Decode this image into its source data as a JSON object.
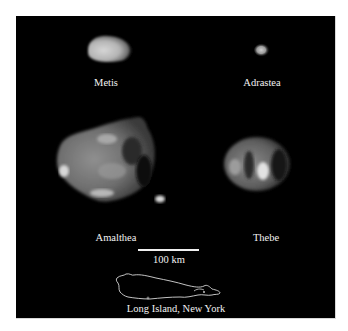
{
  "figure": {
    "moons": [
      {
        "name": "Metis",
        "label": "Metis"
      },
      {
        "name": "Adrastea",
        "label": "Adrastea"
      },
      {
        "name": "Amalthea",
        "label": "Amalthea"
      },
      {
        "name": "Thebe",
        "label": "Thebe"
      }
    ],
    "scale_bar": {
      "label": "100 km"
    },
    "reference": {
      "label": "Long Island, New York"
    },
    "colors": {
      "background": "#000000",
      "page": "#ffffff",
      "text": "#f2f2f2",
      "moon_surface": "#9a9a9a"
    }
  }
}
